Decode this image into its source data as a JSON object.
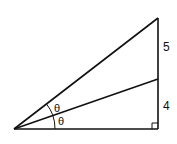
{
  "diagram": {
    "type": "right-triangle-angle-bisector",
    "labels": {
      "upper_segment": "5",
      "lower_segment": "4",
      "angle_upper": "θ",
      "angle_lower": "θ"
    },
    "vertices": {
      "left": [
        14,
        129
      ],
      "bottom_right": [
        158,
        129
      ],
      "top": [
        158,
        18
      ],
      "bisector_foot": [
        158,
        79
      ]
    },
    "colors": {
      "stroke": "#111111",
      "background": "#ffffff"
    }
  }
}
